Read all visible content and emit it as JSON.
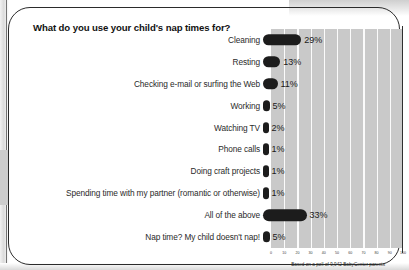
{
  "card": {
    "title": "What do you use your child's nap times for?",
    "footnote": "Based on a poll of 9,942 BabyCenter parents"
  },
  "chart_data": {
    "type": "bar",
    "orientation": "horizontal",
    "title": "What do you use your child's nap times for?",
    "xlabel": "",
    "ylabel": "",
    "xlim": [
      0,
      100
    ],
    "grid": true,
    "legend": null,
    "annotation": "Based on a poll of 9,942 BabyCenter parents",
    "xticks": [
      "0",
      "10",
      "20",
      "30",
      "40",
      "50",
      "60",
      "70",
      "80",
      "90",
      "100"
    ],
    "categories": [
      "Cleaning",
      "Resting",
      "Checking e-mail or surfing the Web",
      "Working",
      "Watching TV",
      "Phone calls",
      "Doing craft projects",
      "Spending time with my partner (romantic or otherwise)",
      "All of the above",
      "Nap time? My child doesn't nap!"
    ],
    "values": [
      29,
      13,
      11,
      5,
      2,
      1,
      1,
      1,
      33,
      5
    ],
    "value_labels": [
      "29%",
      "13%",
      "11%",
      "5%",
      "2%",
      "1%",
      "1%",
      "1%",
      "33%",
      "5%"
    ],
    "colors": {
      "bar": "#1c1c1c",
      "plot_background": "#c9c9c9",
      "gridline": "#ffffff",
      "border": "#2b2b2b"
    }
  }
}
